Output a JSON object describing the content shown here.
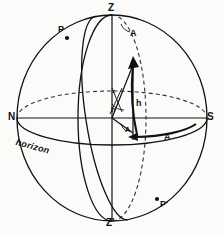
{
  "figure": {
    "background_color": "#fbfbfa",
    "ink_color": "#111111"
  },
  "labels": {
    "zenith": "Z",
    "nadir": "Z′",
    "pole_north": "P",
    "pole_south": "P′",
    "cardinal_north": "N",
    "cardinal_south": "S",
    "horizon": "horizon",
    "azimuth_top": "A",
    "azimuth_horizon": "A",
    "azimuth_center": "A",
    "altitude_arc": "h",
    "altitude_center": "h",
    "zenith_distance": "z"
  },
  "geometry": {
    "sphere_center_x": 112,
    "sphere_center_y": 118,
    "sphere_radius_x": 95,
    "sphere_radius_y": 103,
    "horizon_semi_minor": 27,
    "star_point_x": 133,
    "star_point_y": 133,
    "star_altitude_x": 133,
    "star_altitude_y": 63
  },
  "colors": {
    "line": "#111111",
    "dashed": "#333333",
    "paper": "#fbfbfa"
  }
}
